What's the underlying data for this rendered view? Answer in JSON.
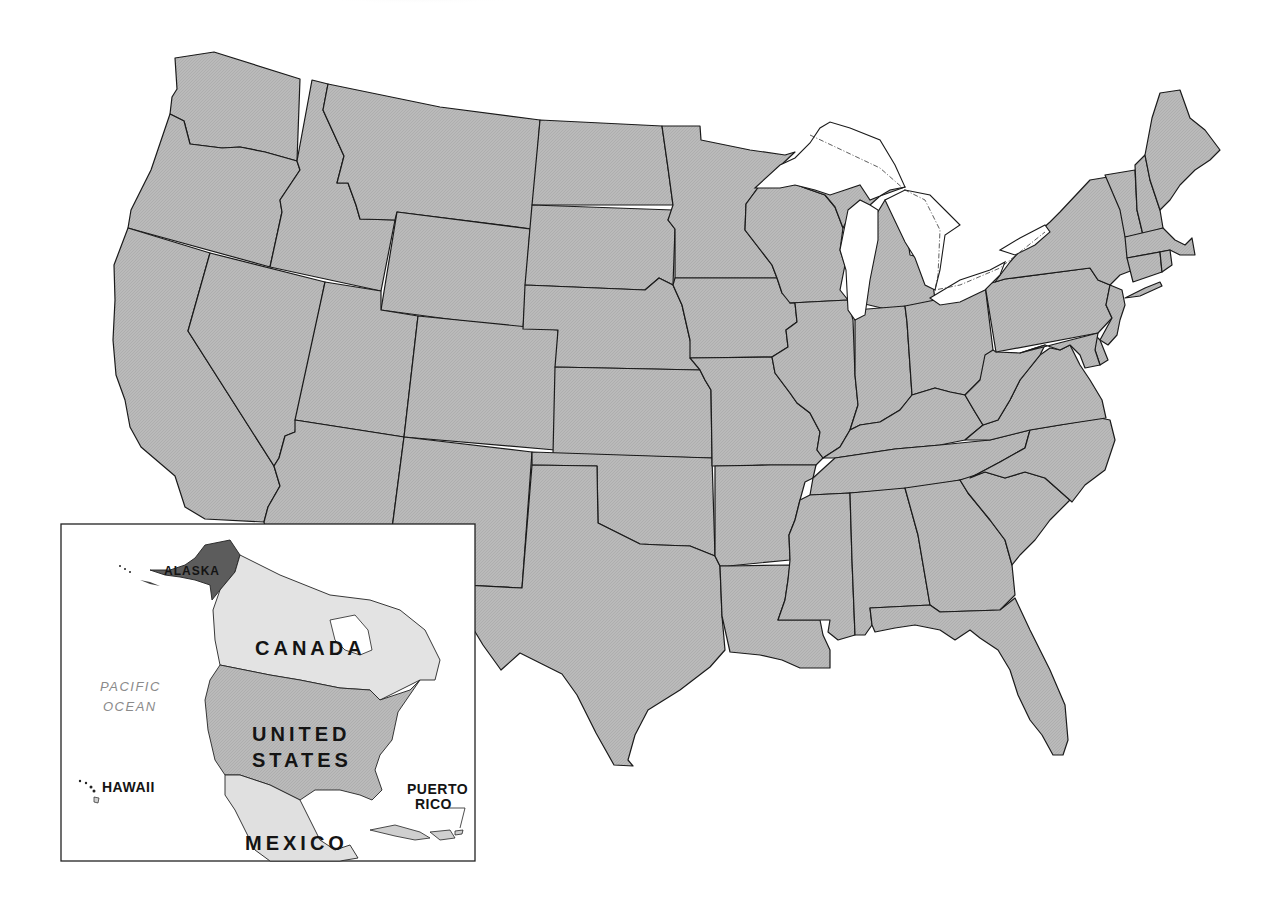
{
  "map": {
    "title": "United States outline map with North America locator inset",
    "main_region": "Contiguous United States (48 states)",
    "colors": {
      "state_fill": "#b8b8b8",
      "state_border": "#1a1a1a",
      "water": "#ffffff",
      "alaska_fill": "#5c5c5c",
      "canada_fill": "#e3e3e3",
      "mexico_fill": "#e0e0e0",
      "ocean_label": "#8a8a8a"
    }
  },
  "inset": {
    "labels": {
      "alaska": "ALASKA",
      "canada": "CANADA",
      "united_states_line1": "UNITED",
      "united_states_line2": "STATES",
      "mexico": "MEXICO",
      "pacific_line1": "PACIFIC",
      "pacific_line2": "OCEAN",
      "hawaii": "HAWAII",
      "puerto_rico_line1": "PUERTO",
      "puerto_rico_line2": "RICO"
    }
  }
}
